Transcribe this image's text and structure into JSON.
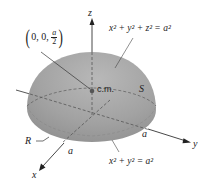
{
  "figure": {
    "type": "hemisphere-center-of-mass",
    "colors": {
      "surface": "#9a9a9a",
      "surface_light": "#b4b4b4",
      "axis": "#333333",
      "dashed": "#555555",
      "cm_dot": "#555555",
      "background": "#ffffff"
    },
    "labels": {
      "z_axis": "z",
      "y_axis": "y",
      "x_axis": "x",
      "cm_point": {
        "prefix": "0, 0, ",
        "frac_num": "a",
        "frac_den": "2"
      },
      "sphere_equation": {
        "base": "x",
        "eq_tail": "a"
      },
      "sphere_equation_text": "x² + y² + z² = a²",
      "disk_equation_text": "x² + y² = a²",
      "cm": "c.m.",
      "surface": "S",
      "region": "R",
      "radius_x": "a",
      "radius_y": "a"
    }
  }
}
